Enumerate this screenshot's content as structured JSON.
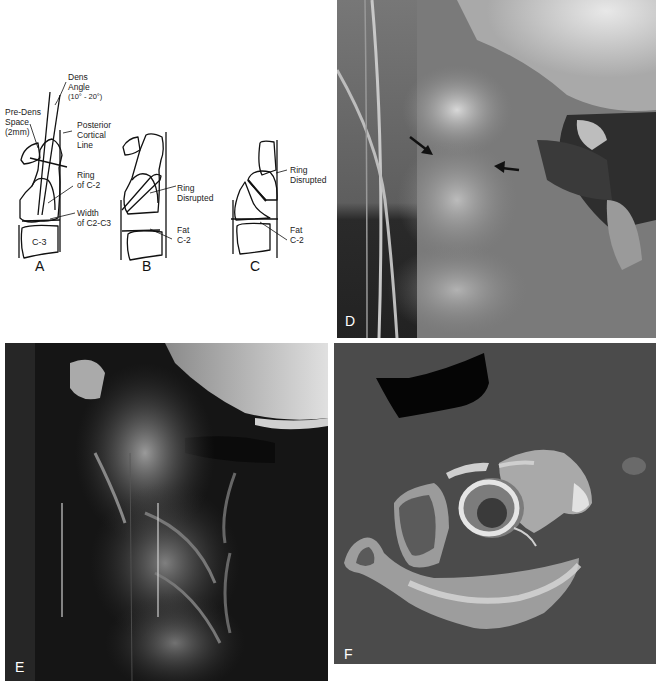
{
  "figure": {
    "panel_a": {
      "letter": "A",
      "annotations": {
        "dens_angle_1": "Dens",
        "dens_angle_2": "Angle",
        "dens_angle_3": "(10° - 20°)",
        "pre_dens_1": "Pre-Dens",
        "pre_dens_2": "Space",
        "pre_dens_3": "(2mm)",
        "posterior_1": "Posterior",
        "posterior_2": "Cortical",
        "posterior_3": "Line",
        "ring_1": "Ring",
        "ring_2": "of C-2",
        "width_1": "Width",
        "width_2": "of C2-C3",
        "vertebra": "C-3"
      }
    },
    "panel_b": {
      "letter": "B",
      "annotations": {
        "ring_1": "Ring",
        "ring_2": "Disrupted",
        "fat_1": "Fat",
        "fat_2": "C-2"
      }
    },
    "panel_c": {
      "letter": "C",
      "annotations": {
        "ring_1": "Ring",
        "ring_2": "Disrupted",
        "fat_1": "Fat",
        "fat_2": "C-2"
      }
    },
    "panel_d": {
      "letter": "D",
      "type": "lateral cervical radiograph with two arrows"
    },
    "panel_e": {
      "letter": "E",
      "type": "lateral cervical radiograph"
    },
    "panel_f": {
      "letter": "F",
      "type": "axial CT of C2"
    }
  }
}
